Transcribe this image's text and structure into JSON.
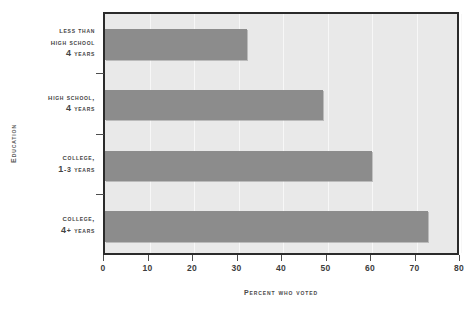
{
  "chart_data": {
    "type": "bar",
    "orientation": "horizontal",
    "title": "",
    "xlabel": "Percent Who Voted",
    "ylabel": "Education",
    "categories": [
      "Less than High School 4 years",
      "High School, 4 years",
      "College, 1-3 years",
      "College, 4+ years"
    ],
    "category_lines": [
      [
        "Less than",
        "High School",
        "4 years"
      ],
      [
        "High School,",
        "4 years"
      ],
      [
        "College,",
        "1-3 years"
      ],
      [
        "College,",
        "4+ years"
      ]
    ],
    "values": [
      32,
      49,
      60,
      72.5
    ],
    "xlim": [
      0,
      80
    ],
    "xticks": [
      0,
      10,
      20,
      30,
      40,
      50,
      60,
      70,
      80
    ],
    "xtick_labels": [
      "0",
      "10",
      "20",
      "30",
      "40",
      "50",
      "60",
      "70",
      "80"
    ],
    "grid": true,
    "grid_axis": "x",
    "legend": false,
    "colors": {
      "bar": "#8c8c8c",
      "plot_background": "#e9e9e9",
      "frame": "#2b2b2b",
      "gridline": "#f7f7f7",
      "text": "#444444",
      "page_background": "#ffffff"
    }
  }
}
